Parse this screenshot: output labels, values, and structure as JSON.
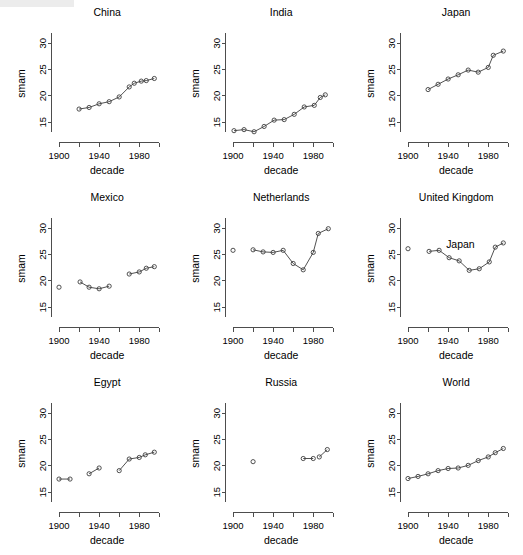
{
  "figure": {
    "axis_label_x": "decade",
    "axis_label_y": "smam",
    "y_ticks": [
      15,
      20,
      25,
      30
    ],
    "x_ticks_labeled": [
      1900,
      1940,
      1980
    ],
    "x_ticks_minor": [
      1920,
      1960,
      2000
    ],
    "xlim": [
      1893,
      2003
    ],
    "ylim": [
      12.2,
      32.5
    ],
    "line_color": "#3d3d3d",
    "axis_color": "#4d4d4d",
    "background": "#ffffff"
  },
  "annotations": [
    {
      "text": "Japan",
      "panel": "United Kingdom",
      "note": "stray text label drawn inside the United Kingdom panel"
    }
  ],
  "chart_data": [
    {
      "type": "line",
      "title": "China",
      "xlabel": "decade",
      "ylabel": "smam",
      "xlim": [
        1893,
        2003
      ],
      "ylim": [
        12.2,
        32.5
      ],
      "grid": false,
      "legend": "none",
      "segments": [
        {
          "x": [
            1920,
            1930,
            1940,
            1950,
            1960,
            1970,
            1975,
            1982,
            1987,
            1995
          ],
          "y": [
            17.5,
            17.8,
            18.5,
            18.9,
            19.8,
            21.7,
            22.4,
            22.8,
            22.9,
            23.3
          ]
        }
      ]
    },
    {
      "type": "line",
      "title": "India",
      "xlabel": "decade",
      "ylabel": "smam",
      "xlim": [
        1893,
        2003
      ],
      "ylim": [
        12.2,
        32.5
      ],
      "grid": false,
      "legend": "none",
      "segments": [
        {
          "x": [
            1901,
            1911,
            1921,
            1931,
            1941,
            1951,
            1961,
            1971,
            1981,
            1987,
            1992
          ],
          "y": [
            13.4,
            13.6,
            13.2,
            14.2,
            15.4,
            15.5,
            16.5,
            17.9,
            18.2,
            19.7,
            20.2
          ]
        }
      ]
    },
    {
      "type": "line",
      "title": "Japan",
      "xlabel": "decade",
      "ylabel": "smam",
      "xlim": [
        1893,
        2003
      ],
      "ylim": [
        12.2,
        32.5
      ],
      "grid": false,
      "legend": "none",
      "segments": [
        {
          "x": [
            1920,
            1930,
            1940,
            1950,
            1960,
            1970,
            1980,
            1985,
            1995
          ],
          "y": [
            21.2,
            22.2,
            23.2,
            24.0,
            24.9,
            24.5,
            25.4,
            27.7,
            28.5
          ]
        }
      ]
    },
    {
      "type": "line",
      "title": "Mexico",
      "xlabel": "decade",
      "ylabel": "smam",
      "xlim": [
        1893,
        2003
      ],
      "ylim": [
        12.2,
        32.5
      ],
      "grid": false,
      "legend": "none",
      "segments": [
        {
          "x": [
            1900
          ],
          "y": [
            18.8
          ]
        },
        {
          "x": [
            1921,
            1930,
            1940,
            1950
          ],
          "y": [
            19.8,
            18.8,
            18.5,
            19.0
          ]
        },
        {
          "x": [
            1970,
            1980,
            1987,
            1995
          ],
          "y": [
            21.3,
            21.7,
            22.4,
            22.7
          ]
        }
      ]
    },
    {
      "type": "line",
      "title": "Netherlands",
      "xlabel": "decade",
      "ylabel": "smam",
      "xlim": [
        1893,
        2003
      ],
      "ylim": [
        12.2,
        32.5
      ],
      "grid": false,
      "legend": "none",
      "segments": [
        {
          "x": [
            1900
          ],
          "y": [
            25.8
          ]
        },
        {
          "x": [
            1920,
            1930,
            1940,
            1950,
            1960,
            1970,
            1980,
            1985,
            1995
          ],
          "y": [
            25.9,
            25.5,
            25.4,
            25.8,
            23.3,
            22.1,
            25.4,
            29.0,
            29.9
          ]
        }
      ]
    },
    {
      "type": "line",
      "title": "United Kingdom",
      "xlabel": "decade",
      "ylabel": "smam",
      "xlim": [
        1893,
        2003
      ],
      "ylim": [
        12.2,
        32.5
      ],
      "grid": false,
      "legend": "none",
      "segments": [
        {
          "x": [
            1900
          ],
          "y": [
            26.1
          ]
        },
        {
          "x": [
            1921,
            1931,
            1941,
            1951,
            1961,
            1971,
            1981,
            1987,
            1995
          ],
          "y": [
            25.6,
            25.8,
            24.4,
            23.8,
            22.0,
            22.3,
            23.6,
            26.4,
            27.2
          ]
        }
      ]
    },
    {
      "type": "line",
      "title": "Egypt",
      "xlabel": "decade",
      "ylabel": "smam",
      "xlim": [
        1893,
        2003
      ],
      "ylim": [
        12.2,
        32.5
      ],
      "grid": false,
      "legend": "none",
      "segments": [
        {
          "x": [
            1900,
            1911
          ],
          "y": [
            17.5,
            17.5
          ]
        },
        {
          "x": [
            1930,
            1940
          ],
          "y": [
            18.5,
            19.6
          ]
        },
        {
          "x": [
            1960,
            1970,
            1980,
            1986,
            1995
          ],
          "y": [
            19.1,
            21.3,
            21.6,
            22.1,
            22.6
          ]
        }
      ]
    },
    {
      "type": "line",
      "title": "Russia",
      "xlabel": "decade",
      "ylabel": "smam",
      "xlim": [
        1893,
        2003
      ],
      "ylim": [
        12.2,
        32.5
      ],
      "grid": false,
      "legend": "none",
      "segments": [
        {
          "x": [
            1920
          ],
          "y": [
            20.8
          ]
        },
        {
          "x": [
            1970,
            1980
          ],
          "y": [
            21.4,
            21.4
          ]
        },
        {
          "x": [
            1986,
            1994
          ],
          "y": [
            21.7,
            23.1
          ]
        }
      ]
    },
    {
      "type": "line",
      "title": "World",
      "xlabel": "decade",
      "ylabel": "smam",
      "xlim": [
        1893,
        2003
      ],
      "ylim": [
        12.2,
        32.5
      ],
      "grid": false,
      "legend": "none",
      "segments": [
        {
          "x": [
            1900,
            1910,
            1920,
            1930,
            1940,
            1950,
            1960,
            1970,
            1980,
            1987,
            1995
          ],
          "y": [
            17.6,
            18.0,
            18.5,
            19.1,
            19.5,
            19.6,
            20.1,
            21.0,
            21.7,
            22.5,
            23.3
          ]
        }
      ]
    }
  ]
}
